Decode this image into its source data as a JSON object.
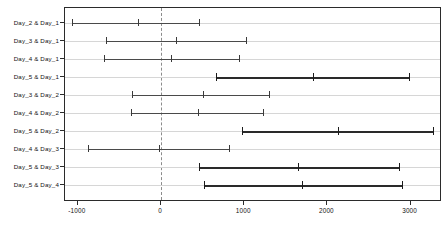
{
  "chart_data": {
    "type": "errorbar",
    "title": "",
    "xlabel": "",
    "ylabel": "",
    "xlim": [
      -1200,
      3450
    ],
    "ylim": [
      0,
      11
    ],
    "grid": false,
    "legend": null,
    "zero_reference_line": 0,
    "xticks": [
      -1000,
      0,
      1000,
      2000,
      3000
    ],
    "xticklabels": [
      "-1000",
      "0",
      "1000",
      "2000",
      "3000"
    ],
    "categories": [
      "Day_2 & Day_1",
      "Day_3 & Day_1",
      "Day_4 & Day_1",
      "Day_5 & Day_1",
      "Day_3 & Day_2",
      "Day_4 & Day_2",
      "Day_5 & Day_2",
      "Day_4 & Day_3",
      "Day_5 & Day_3",
      "Day_5 & Day_4"
    ],
    "rows": [
      {
        "label": "Day_2 & Day_1",
        "lower": -1068,
        "center": -276,
        "upper": 456,
        "significant": false
      },
      {
        "label": "Day_3 & Day_1",
        "lower": -660,
        "center": 180,
        "upper": 1020,
        "significant": false
      },
      {
        "label": "Day_4 & Day_1",
        "lower": -684,
        "center": 120,
        "upper": 936,
        "significant": false
      },
      {
        "label": "Day_5 & Day_1",
        "lower": 660,
        "center": 1824,
        "upper": 2976,
        "significant": true
      },
      {
        "label": "Day_3 & Day_2",
        "lower": -348,
        "center": 504,
        "upper": 1296,
        "significant": false
      },
      {
        "label": "Day_4 & Day_2",
        "lower": -360,
        "center": 444,
        "upper": 1224,
        "significant": false
      },
      {
        "label": "Day_5 & Day_2",
        "lower": 972,
        "center": 2124,
        "upper": 3264,
        "significant": true
      },
      {
        "label": "Day_4 & Day_3",
        "lower": -876,
        "center": -24,
        "upper": 816,
        "significant": false
      },
      {
        "label": "Day_5 & Day_3",
        "lower": 456,
        "center": 1644,
        "upper": 2856,
        "significant": true
      },
      {
        "label": "Day_5 & Day_4",
        "lower": 516,
        "center": 1692,
        "upper": 2892,
        "significant": true
      }
    ],
    "colors": {
      "frame": "#2b2b2b",
      "interval": "#4a4a4a",
      "interval_significant": "#1c1c1c",
      "baseline": "#d6d6d6",
      "zero_line": "#8c8c8c",
      "background": "#ffffff",
      "text": "#111111"
    }
  }
}
